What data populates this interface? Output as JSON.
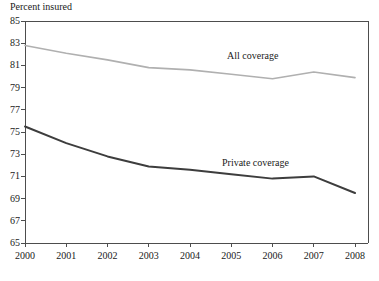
{
  "chart_data": {
    "type": "line",
    "title": "",
    "ylabel": "Percent insured",
    "xlabel": "",
    "categories": [
      "2000",
      "2001",
      "2002",
      "2003",
      "2004",
      "2005",
      "2006",
      "2007",
      "2008"
    ],
    "x": [
      2000,
      2001,
      2002,
      2003,
      2004,
      2005,
      2006,
      2007,
      2008
    ],
    "ylim": [
      65,
      85
    ],
    "yticks": [
      65,
      67,
      69,
      71,
      73,
      75,
      77,
      79,
      81,
      83,
      85
    ],
    "ytick_labels": [
      "65",
      "67",
      "69",
      "71",
      "73",
      "75",
      "77",
      "79",
      "81",
      "83",
      "85"
    ],
    "xlim": [
      2000,
      2008
    ],
    "grid": false,
    "legend_position": "inline-annotation",
    "series": [
      {
        "name": "All coverage",
        "color": "#b0b0b0",
        "values": [
          82.8,
          82.1,
          81.5,
          80.8,
          80.6,
          80.2,
          79.8,
          80.4,
          79.9
        ],
        "annotation": "All coverage"
      },
      {
        "name": "Private coverage",
        "color": "#3d3d3d",
        "values": [
          75.5,
          74.0,
          72.8,
          71.9,
          71.6,
          71.2,
          70.8,
          71.0,
          69.5
        ],
        "annotation": "Private coverage"
      }
    ],
    "annotations": [
      {
        "text": "All coverage",
        "x_px": 227,
        "y_px": 50
      },
      {
        "text": "Private coverage",
        "x_px": 222,
        "y_px": 157
      }
    ],
    "axis_color": "#4d4d4d",
    "background": "#ffffff"
  },
  "geometry": {
    "plot_left": 25,
    "plot_right": 368,
    "plot_top": 21,
    "plot_bottom": 243,
    "x_first": 25,
    "x_step": 41.25,
    "y_min_value": 65,
    "y_max_value": 85,
    "y_px_per_unit": 11.1
  }
}
